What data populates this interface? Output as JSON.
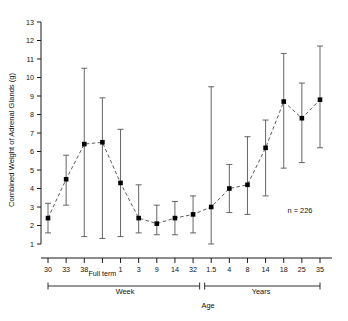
{
  "chart_data": {
    "type": "line",
    "title": "",
    "xlabel": "Age",
    "ylabel": "Combined Weight of Adrenal Glands (g)",
    "ylim": [
      1,
      13
    ],
    "yticks": [
      1,
      2,
      3,
      4,
      5,
      6,
      7,
      8,
      9,
      10,
      11,
      12,
      13
    ],
    "grid": false,
    "legend": null,
    "annotation": "n = 226",
    "line_style": "dashed",
    "marker": "filled-square",
    "error_bars": "vertical-capped",
    "axis_break": true,
    "categories": [
      "30",
      "33",
      "38",
      "Full term",
      "1",
      "3",
      "9",
      "14",
      "32",
      "1.5",
      "4",
      "8",
      "14",
      "18",
      "25",
      "35"
    ],
    "xtick_labels": [
      "30",
      "33",
      "38",
      "Full term",
      "1",
      "3",
      "9",
      "14",
      "32",
      "1.5",
      "4",
      "8",
      "14",
      "18",
      "25",
      "35"
    ],
    "x_group_brackets": [
      {
        "label": "Week",
        "from": "30",
        "to": "32"
      },
      {
        "label": "Years",
        "from": "1.5",
        "to": "35"
      }
    ],
    "values": [
      2.4,
      4.5,
      6.4,
      6.5,
      4.3,
      2.4,
      2.1,
      2.4,
      2.6,
      3.0,
      4.0,
      4.2,
      6.2,
      8.7,
      7.8,
      8.8
    ],
    "err_low": [
      1.6,
      3.1,
      1.4,
      1.3,
      1.4,
      1.6,
      1.5,
      1.5,
      1.6,
      1.0,
      2.7,
      2.6,
      3.6,
      5.1,
      5.4,
      6.2
    ],
    "err_high": [
      3.2,
      5.8,
      10.5,
      8.9,
      7.2,
      4.2,
      3.1,
      3.3,
      3.6,
      9.5,
      5.3,
      6.8,
      7.7,
      11.3,
      9.7,
      11.7
    ],
    "series": [
      {
        "name": "Combined adrenal weight",
        "points": [
          {
            "x": "30",
            "y": 2.4,
            "low": 1.6,
            "high": 3.2
          },
          {
            "x": "33",
            "y": 4.5,
            "low": 3.1,
            "high": 5.8
          },
          {
            "x": "38",
            "y": 6.4,
            "low": 1.4,
            "high": 10.5
          },
          {
            "x": "Full term",
            "y": 6.5,
            "low": 1.3,
            "high": 8.9
          },
          {
            "x": "1",
            "y": 4.3,
            "low": 1.4,
            "high": 7.2
          },
          {
            "x": "3",
            "y": 2.4,
            "low": 1.6,
            "high": 4.2
          },
          {
            "x": "9",
            "y": 2.1,
            "low": 1.5,
            "high": 3.1
          },
          {
            "x": "14",
            "y": 2.4,
            "low": 1.5,
            "high": 3.3
          },
          {
            "x": "32",
            "y": 2.6,
            "low": 1.6,
            "high": 3.6
          },
          {
            "x": "1.5",
            "y": 3.0,
            "low": 1.0,
            "high": 9.5
          },
          {
            "x": "4",
            "y": 4.0,
            "low": 2.7,
            "high": 5.3
          },
          {
            "x": "8",
            "y": 4.2,
            "low": 2.6,
            "high": 6.8
          },
          {
            "x": "14",
            "y": 6.2,
            "low": 3.6,
            "high": 7.7
          },
          {
            "x": "18",
            "y": 8.7,
            "low": 5.1,
            "high": 11.3
          },
          {
            "x": "25",
            "y": 7.8,
            "low": 5.4,
            "high": 9.7
          },
          {
            "x": "35",
            "y": 8.8,
            "low": 6.2,
            "high": 11.7
          }
        ]
      }
    ]
  },
  "axes": {
    "y_title": "Combined Weight of Adrenal Glands (g)",
    "x_title": "Age",
    "group_week": "Week",
    "group_years": "Years",
    "full_term_label": "Full term"
  },
  "annotations": {
    "sample_size": "n = 226"
  },
  "ticks": {
    "y": [
      "13",
      "12",
      "11",
      "10",
      "9",
      "8",
      "7",
      "6",
      "5",
      "4",
      "3",
      "2",
      "1"
    ],
    "x": [
      "30",
      "33",
      "38",
      "",
      "1",
      "3",
      "9",
      "14",
      "32",
      "1.5",
      "4",
      "8",
      "14",
      "18",
      "25",
      "35"
    ]
  },
  "colors": {
    "axis": "#1a1a1a",
    "marker": "#000000",
    "line": "#4a4a4a",
    "error": "#555555",
    "background": "#ffffff"
  }
}
